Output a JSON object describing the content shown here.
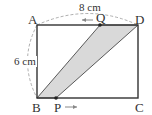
{
  "diagram": {
    "type": "rectangle with moving points",
    "vertices": {
      "A": "A",
      "B": "B",
      "C": "C",
      "D": "D"
    },
    "moving_points": {
      "P": "P",
      "Q": "Q"
    },
    "dimensions": {
      "top": "8 cm",
      "left": "6 cm"
    },
    "arrows": {
      "Q_direction": "left",
      "P_direction": "right"
    },
    "shaded_region": "quadrilateral B-P-D-Q",
    "colors": {
      "line": "#333333",
      "shade": "#d9d9d9",
      "dashed": "#999999"
    }
  }
}
